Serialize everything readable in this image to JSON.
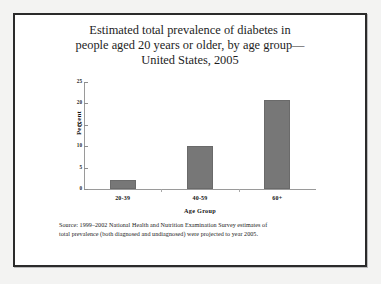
{
  "figure": {
    "title_lines": [
      "Estimated total prevalence of diabetes in",
      "people aged 20 years or older, by age group—",
      "United States, 2005"
    ],
    "source_lines": [
      "Source: 1999–2002 National Health and Nutrition Examination Survey estimates of",
      "total prevalence (both diagnosed and undiagnosed) were projected to year 2005."
    ],
    "frame_color": "#2b2b2b",
    "bar_color": "#777777",
    "axis_color": "#9a9a9a",
    "page_background": "#f3f3f2"
  },
  "chart_data": {
    "type": "bar",
    "xlabel": "Age Group",
    "ylabel": "Percent",
    "categories": [
      "20-39",
      "40-59",
      "60+"
    ],
    "values": [
      2.2,
      10.1,
      20.8
    ],
    "ylim": [
      0,
      25
    ],
    "yticks": [
      0,
      5,
      10,
      15,
      20,
      25
    ],
    "ytick_labels": [
      "0",
      "5",
      "10",
      "15",
      "20",
      "25"
    ],
    "grid": false,
    "legend": false,
    "series": [
      {
        "name": "Total prevalence of diabetes",
        "values": [
          2.2,
          10.1,
          20.8
        ]
      }
    ]
  }
}
